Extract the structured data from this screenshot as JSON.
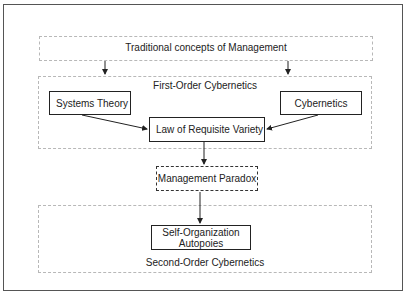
{
  "diagram": {
    "top_region": {
      "label": "Traditional concepts of Management"
    },
    "first_order": {
      "label": "First-Order Cybernetics",
      "nodes": {
        "systems_theory": "Systems Theory",
        "cybernetics": "Cybernetics",
        "law_of_requisite_variety": "Law of Requisite Variety"
      }
    },
    "management_paradox": {
      "label": "Management Paradox"
    },
    "second_order": {
      "label": "Second-Order Cybernetics",
      "node": {
        "line1": "Self-Organization",
        "line2": "Autopoies"
      }
    },
    "colors": {
      "node_border": "#222222",
      "region_border": "#b8b8b8",
      "frame_border": "#555555",
      "arrow": "#222222"
    }
  }
}
